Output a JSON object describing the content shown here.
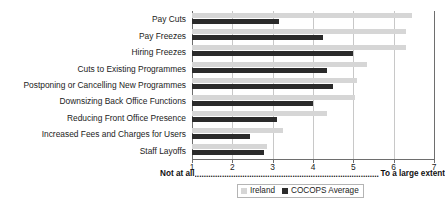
{
  "chart_data": {
    "type": "bar",
    "orientation": "horizontal",
    "title": "",
    "subtitle": "",
    "xlabel": "",
    "ylabel": "",
    "xlim": [
      1,
      7
    ],
    "xticks": [
      1,
      2,
      3,
      4,
      5,
      6,
      7
    ],
    "xtick_labels": [
      "1",
      "2",
      "3",
      "4",
      "5",
      "6",
      "7"
    ],
    "grid": true,
    "grid_axis": "x",
    "legend_position": "bottom-center",
    "categories": [
      "Pay Cuts",
      "Pay Freezes",
      "Hiring Freezes",
      "Cuts to Existing Programmes",
      "Postponing or Cancelling New Programmes",
      "Downsizing Back Office Functions",
      "Reducing Front Office Presence",
      "Increased Fees and Charges for Users",
      "Staff Layoffs"
    ],
    "series": [
      {
        "name": "Ireland",
        "color": "#d6d6d6",
        "values": [
          6.45,
          6.3,
          6.3,
          5.35,
          5.1,
          5.05,
          4.35,
          3.25,
          2.85
        ]
      },
      {
        "name": "COCOPS Average",
        "color": "#2b2b2b",
        "values": [
          3.15,
          4.25,
          5.0,
          4.35,
          4.5,
          4.0,
          3.1,
          2.45,
          2.78
        ]
      }
    ],
    "anchors": {
      "left": "Not at all",
      "right": "To a large extent",
      "leader": "................................................................................."
    }
  },
  "legend": {
    "items": [
      {
        "label": "Ireland",
        "color": "#d6d6d6"
      },
      {
        "label": "COCOPS Average",
        "color": "#2b2b2b"
      }
    ]
  }
}
